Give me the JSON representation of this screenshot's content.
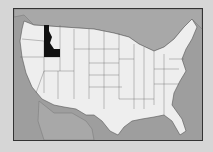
{
  "map": {
    "title": "United States map",
    "highlighted_state": "Idaho",
    "colors": {
      "background": "#d6d6d6",
      "water": "#9e9e9e",
      "canada": "#a8a8a8",
      "mexico": "#a8a8a8",
      "land": "#eeeeee",
      "highlight": "#111111",
      "border": "#333333"
    }
  }
}
